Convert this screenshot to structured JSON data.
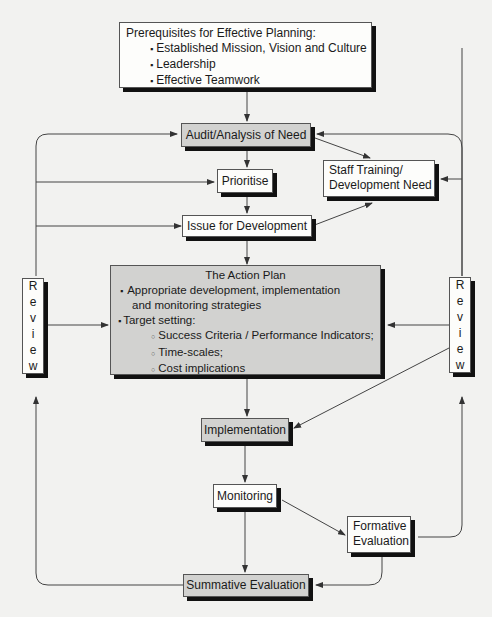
{
  "prerequisites": {
    "title": "Prerequisites for Effective Planning:",
    "items": [
      "Established Mission, Vision and Culture",
      "Leadership",
      "Effective Teamwork"
    ],
    "bullet": "▪"
  },
  "nodes": {
    "audit": "Audit/Analysis of Need",
    "prioritise": "Prioritise",
    "issue": "Issue for Development",
    "staff_line1": "Staff Training/",
    "staff_line2": "Development Need",
    "implementation": "Implementation",
    "monitoring": "Monitoring",
    "formative_line1": "Formative",
    "formative_line2": "Evaluation",
    "summative": "Summative Evaluation"
  },
  "action_plan": {
    "title": "The Action Plan",
    "bullet": "▪",
    "sub_bullet": "○",
    "item1_line1": "Appropriate development, implementation",
    "item1_line2": "and monitoring strategies",
    "item2": "Target setting:",
    "sub_items": [
      "Success Criteria / Performance Indicators;",
      "Time-scales;",
      "Cost implications"
    ]
  },
  "review": {
    "letters": [
      "R",
      "e",
      "v",
      "i",
      "e",
      "w"
    ]
  },
  "colors": {
    "grey_box": "#d2d2d0",
    "white_box": "#fdfdfb",
    "line": "#444444",
    "background": "#f2f2f0"
  }
}
